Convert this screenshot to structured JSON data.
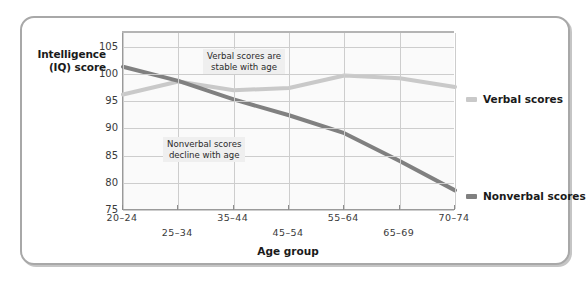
{
  "figure": {
    "background_color": "#ffffff",
    "frame_border_color": "#a8a8a8"
  },
  "axes": {
    "y_title": "Intelligence\n(IQ) score",
    "x_title": "Age group"
  },
  "annotations": [
    {
      "name": "verbal-note",
      "text": "Verbal scores are\nstable with age"
    },
    {
      "name": "nonverbal-note",
      "text": "Nonverbal scores\ndecline with age"
    }
  ],
  "legend": {
    "position": "right",
    "items": [
      {
        "label": "Verbal scores",
        "color": "#c9c9c9"
      },
      {
        "label": "Nonverbal scores",
        "color": "#808080"
      }
    ]
  },
  "chart_data": {
    "type": "line",
    "title": "",
    "subtitle": "",
    "xlabel": "Age group",
    "ylabel": "Intelligence (IQ) score",
    "categories": [
      "20-24",
      "25-34",
      "35-44",
      "45-54",
      "55-64",
      "65-69",
      "70-74"
    ],
    "x_tick_labels": [
      "20–24",
      "25–34",
      "35–44",
      "45–54",
      "55–64",
      "65–69",
      "70–74"
    ],
    "y_tick_labels": [
      "105",
      "100",
      "95",
      "90",
      "85",
      "80",
      "75"
    ],
    "y_ticks": [
      105,
      100,
      95,
      90,
      85,
      80,
      75
    ],
    "ylim": [
      75,
      107.5
    ],
    "xlim": [
      0,
      6
    ],
    "grid": true,
    "legend_position": "right",
    "series": [
      {
        "name": "Verbal scores",
        "color": "#c9c9c9",
        "values": [
          96.2,
          98.6,
          97.0,
          97.4,
          99.7,
          99.2,
          97.6
        ]
      },
      {
        "name": "Nonverbal scores",
        "color": "#808080",
        "values": [
          101.3,
          98.7,
          95.3,
          92.4,
          89.1,
          84.0,
          78.6
        ]
      }
    ],
    "annotations": [
      {
        "text": "Verbal scores are stable with age",
        "near_series": "Verbal scores"
      },
      {
        "text": "Nonverbal scores decline with age",
        "near_series": "Nonverbal scores"
      }
    ]
  }
}
